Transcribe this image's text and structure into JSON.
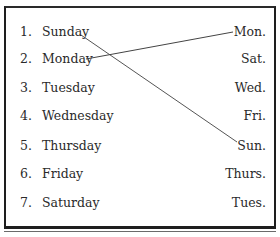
{
  "exercise": {
    "left_items": [
      {
        "number": "1.",
        "label": "Sunday"
      },
      {
        "number": "2.",
        "label": "Monday"
      },
      {
        "number": "3.",
        "label": "Tuesday"
      },
      {
        "number": "4.",
        "label": "Wednesday"
      },
      {
        "number": "5.",
        "label": "Thursday"
      },
      {
        "number": "6.",
        "label": "Friday"
      },
      {
        "number": "7.",
        "label": "Saturday"
      }
    ],
    "right_items": [
      "Mon.",
      "Sat.",
      "Wed.",
      "Fri.",
      "Sun.",
      "Thurs.",
      "Tues."
    ],
    "connections": [
      {
        "from": "Sunday",
        "to": "Sun."
      },
      {
        "from": "Monday",
        "to": "Mon."
      }
    ]
  }
}
